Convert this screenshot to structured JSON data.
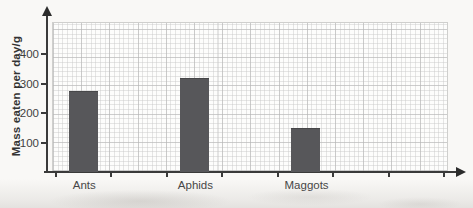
{
  "chart_data": {
    "type": "bar",
    "title": "",
    "xlabel": "",
    "ylabel": "Mass eaten per day/g",
    "categories": [
      "Ants",
      "Aphids",
      "Maggots"
    ],
    "values": [
      275,
      320,
      150
    ],
    "y_ticks": [
      100,
      200,
      300,
      400
    ],
    "ylim": [
      0,
      500
    ],
    "grid": true,
    "legend": "none",
    "colors": {
      "bar": "#57575a",
      "axis": "#3a3a3a",
      "grid_minor": "#d9d9d9",
      "grid_major": "#bfbfbf",
      "text": "#3f3f3f",
      "paper": "#f9f8f6"
    }
  }
}
